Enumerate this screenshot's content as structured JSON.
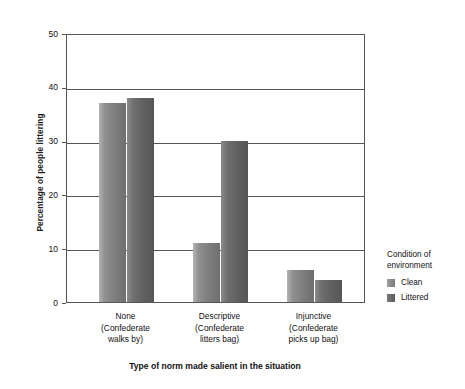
{
  "chart_data": {
    "type": "bar",
    "title": "",
    "xlabel": "Type of norm made salient in the situation",
    "ylabel": "Percentage of people littering",
    "categories": [
      "None\n(Confederate\nwalks by)",
      "Descriptive\n(Confederate\nlitters bag)",
      "Injunctive\n(Confederate\npicks up bag)"
    ],
    "category_lines": [
      [
        "None",
        "(Confederate",
        "walks by)"
      ],
      [
        "Descriptive",
        "(Confederate",
        "litters bag)"
      ],
      [
        "Injunctive",
        "(Confederate",
        "picks up bag)"
      ]
    ],
    "series": [
      {
        "name": "Clean",
        "values": [
          37,
          11,
          6
        ]
      },
      {
        "name": "Littered",
        "values": [
          38,
          30,
          4
        ]
      }
    ],
    "ylim": [
      0,
      50
    ],
    "yticks": [
      0,
      10,
      20,
      30,
      40,
      50
    ],
    "ytick_labels": [
      "0",
      "10",
      "20",
      "30",
      "40",
      "50"
    ],
    "grid": true,
    "legend": {
      "title_lines": [
        "Condition of",
        "environment"
      ],
      "position": "right",
      "entries": [
        {
          "label": "Clean",
          "color": "#7b7b7b"
        },
        {
          "label": "Littered",
          "color": "#5a5a5a"
        }
      ]
    },
    "colors": {
      "clean": "#7d7d7d",
      "littered": "#5f5f5f",
      "axis": "#555555",
      "text": "#111111",
      "background": "#ffffff"
    }
  }
}
